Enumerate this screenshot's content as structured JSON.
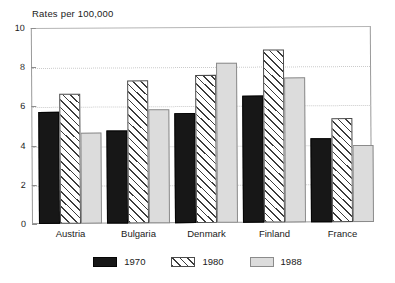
{
  "chart_data": {
    "type": "bar",
    "title": "Rates per 100,000",
    "xlabel": "",
    "ylabel": "",
    "ylim": [
      0,
      10
    ],
    "yticks": [
      0,
      2,
      4,
      6,
      8,
      10
    ],
    "ytick_labels": [
      "0",
      "2",
      "4",
      "6",
      "8",
      "10"
    ],
    "grid": true,
    "grid_style": "dotted horizontal gridlines at 2, 4, 6, 8",
    "legend_position": "bottom-center",
    "categories": [
      "Austria",
      "Bulgaria",
      "Denmark",
      "Finland",
      "France"
    ],
    "series": [
      {
        "name": "1970",
        "color": "#171717",
        "fill": "solid",
        "values": [
          5.7,
          4.75,
          5.6,
          6.5,
          4.3
        ]
      },
      {
        "name": "1980",
        "color": "#ffffff",
        "fill": "diagonal-hatch",
        "values": [
          6.65,
          7.3,
          7.55,
          8.85,
          5.3
        ]
      },
      {
        "name": "1988",
        "color": "#dcdcdc",
        "fill": "solid",
        "values": [
          4.65,
          5.8,
          8.15,
          7.4,
          3.95
        ]
      }
    ]
  },
  "legend": {
    "items": [
      {
        "label": "1970",
        "swatch": "solid-black-swatch"
      },
      {
        "label": "1980",
        "swatch": "hatched-swatch"
      },
      {
        "label": "1988",
        "swatch": "light-gray-swatch"
      }
    ]
  },
  "colors": {
    "series_1970": "#171717",
    "series_1980": "#ffffff",
    "series_1988": "#dcdcdc",
    "frame": "#9a9a9a",
    "gridline": "#c9c9c9",
    "text": "#1a1a1a",
    "background": "#ffffff"
  }
}
